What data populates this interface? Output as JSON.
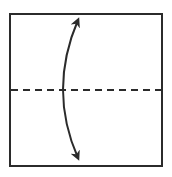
{
  "diagram": {
    "type": "origami-fold-instruction",
    "colors": {
      "stroke": "#2b2b2b",
      "background": "#ffffff"
    },
    "square": {
      "x": 10,
      "y": 14,
      "width": 152,
      "height": 152
    },
    "fold_line": {
      "style": "dashed",
      "orientation": "horizontal",
      "y": 90
    },
    "arrow": {
      "style": "curved-double-headed",
      "from": [
        79,
        17
      ],
      "to": [
        81,
        161
      ]
    }
  }
}
